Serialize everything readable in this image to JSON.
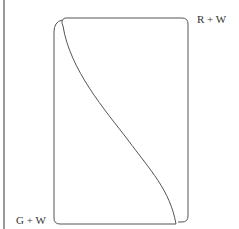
{
  "diagram": {
    "labels": {
      "top_right": "R + W",
      "bottom_left": "G + W"
    },
    "colors": {
      "stroke": "#444444",
      "text": "#333333",
      "background": "#ffffff"
    }
  }
}
